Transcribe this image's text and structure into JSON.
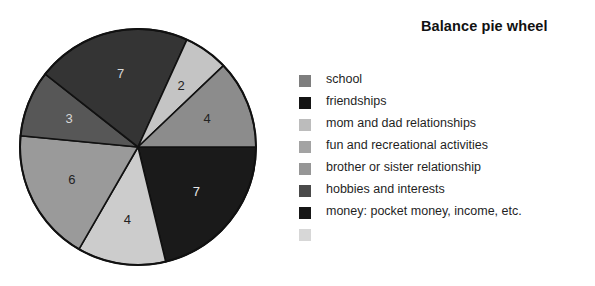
{
  "title": "Balance pie wheel",
  "background_color": "#ffffff",
  "chart_data": {
    "type": "pie",
    "title": "Balance pie wheel",
    "xlabel": "",
    "ylabel": "",
    "total": 33,
    "start_angle_deg": 0,
    "direction": "clockwise",
    "outline_color": "#111111",
    "legend_position": "right",
    "grid": false,
    "categories": [
      "school",
      "friendships",
      "mom and dad relationships",
      "fun and recreational activities",
      "brother or sister relationship",
      "hobbies and interests",
      "money: pocket money, income, etc."
    ],
    "values": [
      4,
      7,
      4,
      6,
      3,
      7,
      2
    ],
    "slices": [
      {
        "label": "friendships",
        "value": 7,
        "value_text": "7",
        "color": "#1a1a1a",
        "text_color": "#e8e8e8",
        "start_deg": 0,
        "end_deg": 76.4
      },
      {
        "label": "mom and dad relationships",
        "value": 4,
        "value_text": "4",
        "color": "#cccccc",
        "text_color": "#222222",
        "start_deg": 76.4,
        "end_deg": 120.0
      },
      {
        "label": "fun and recreational activities",
        "value": 6,
        "value_text": "6",
        "color": "#9a9a9a",
        "text_color": "#232323",
        "start_deg": 120.0,
        "end_deg": 185.5
      },
      {
        "label": "brother or sister relationship",
        "value": 3,
        "value_text": "3",
        "color": "#575757",
        "text_color": "#d8d8d8",
        "start_deg": 185.5,
        "end_deg": 218.2
      },
      {
        "label": "hobbies and interests",
        "value": 7,
        "value_text": "7",
        "color": "#343434",
        "text_color": "#d8d8d8",
        "start_deg": 218.2,
        "end_deg": 294.5
      },
      {
        "label": "money: pocket money, income, etc.",
        "value": 2,
        "value_text": "2",
        "color": "#c4c4c4",
        "text_color": "#222222",
        "start_deg": 294.5,
        "end_deg": 316.4
      },
      {
        "label": "school",
        "value": 4,
        "value_text": "4",
        "color": "#8c8c8c",
        "text_color": "#232323",
        "start_deg": 316.4,
        "end_deg": 360.0
      }
    ]
  },
  "legend": {
    "labels": [
      "school",
      "friendships",
      "mom and dad relationships",
      "fun and recreational activities",
      "brother or sister relationship",
      "hobbies and interests",
      "money: pocket money, income, etc."
    ],
    "swatch_colors": [
      "#7e7e7e",
      "#141414",
      "#bcbcbc",
      "#a3a3a3",
      "#969696",
      "#4a4a4a",
      "#161616",
      "#d7d7d7"
    ]
  },
  "geometry": {
    "center_x": 138,
    "center_y": 147,
    "radius": 118
  }
}
